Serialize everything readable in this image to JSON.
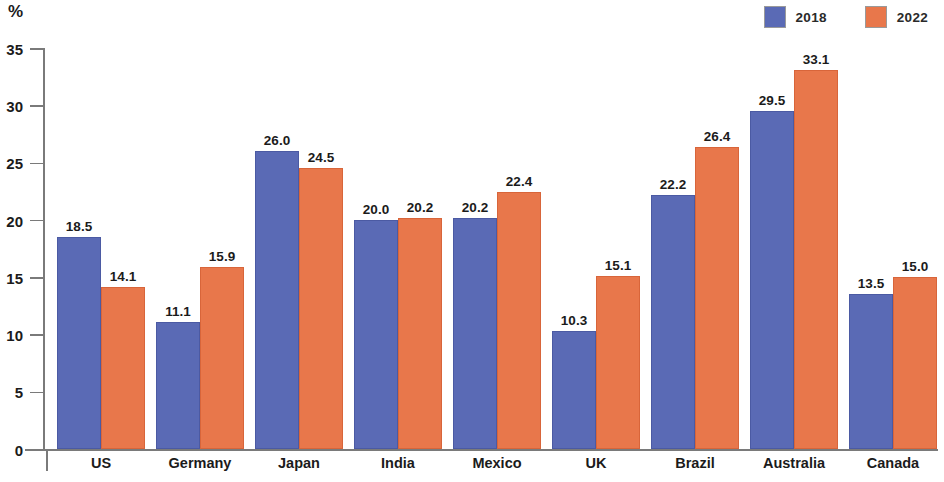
{
  "axis_unit_label": "%",
  "legend": {
    "position": "top-right",
    "items": [
      {
        "label": "2018",
        "color": "#5a6ab5",
        "swatch_icon": "square-swatch-icon"
      },
      {
        "label": "2022",
        "color": "#e8774b",
        "swatch_icon": "square-swatch-icon"
      }
    ]
  },
  "chart_data": {
    "type": "bar",
    "title": "",
    "subtitle": "",
    "xlabel": "",
    "ylabel": "%",
    "ylim": [
      0,
      35
    ],
    "yticks": [
      0,
      5,
      10,
      15,
      20,
      25,
      30,
      35
    ],
    "ytick_labels": [
      "0",
      "5",
      "10",
      "15",
      "20",
      "25",
      "30",
      "35"
    ],
    "grid": false,
    "legend_position": "top-right",
    "categories": [
      "US",
      "Germany",
      "Japan",
      "India",
      "Mexico",
      "UK",
      "Brazil",
      "Australia",
      "Canada"
    ],
    "series": [
      {
        "name": "2018",
        "color": "#5a6ab5",
        "values": [
          18.5,
          11.1,
          26.0,
          20.0,
          20.2,
          10.3,
          22.2,
          29.5,
          13.5
        ],
        "value_labels": [
          "18.5",
          "11.1",
          "26.0",
          "20.0",
          "20.2",
          "10.3",
          "22.2",
          "29.5",
          "13.5"
        ]
      },
      {
        "name": "2022",
        "color": "#e8774b",
        "values": [
          14.1,
          15.9,
          24.5,
          20.2,
          22.4,
          15.1,
          26.4,
          33.1,
          15.0
        ],
        "value_labels": [
          "14.1",
          "15.9",
          "24.5",
          "20.2",
          "22.4",
          "15.1",
          "26.4",
          "33.1",
          "15.0"
        ]
      }
    ]
  }
}
